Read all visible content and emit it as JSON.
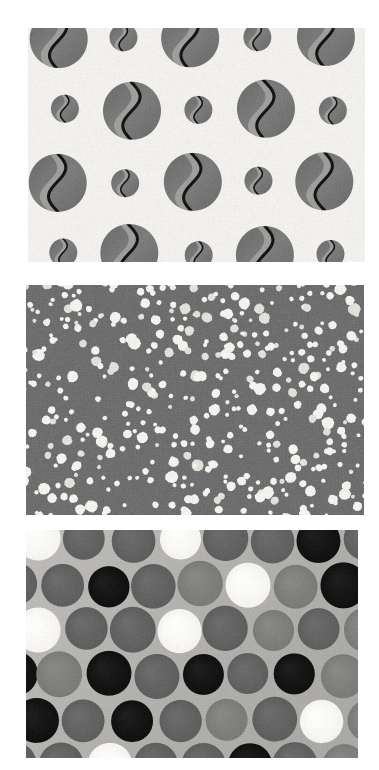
{
  "image": {
    "kind": "photo-collage",
    "description": "Three stacked photographs of polka-dot patterned fabric swatches",
    "background_color": "#ffffff",
    "width": 379,
    "height": 770
  },
  "panels": [
    {
      "id": "beans",
      "name": "coffee-bean-dot-fabric",
      "label": "Cream fabric with gray coffee-bean dots",
      "x": 28,
      "y": 28,
      "width": 337,
      "height": 234,
      "background_color": "#f2f0ec",
      "texture": "woven-linen",
      "pattern_type": "grid",
      "motif": "bean",
      "colors": {
        "fabric": "#f2f0ec",
        "dot_fill": "#7d7d7d",
        "dot_shadow": "#6a6a6a",
        "dot_highlight": "#a7a5a1",
        "bean_line": "#151515"
      },
      "grid": {
        "columns": 6,
        "rows": 4,
        "cell_width": 67,
        "cell_height": 72
      },
      "dot_sizes": {
        "large_radius": 29,
        "small_radius": 14
      },
      "dot_count": 24
    },
    {
      "id": "speckle",
      "name": "white-speckle-dot-fabric",
      "label": "Gray fabric with scattered small white dots",
      "x": 26,
      "y": 285,
      "width": 338,
      "height": 230,
      "background_color": "#6e6e6e",
      "texture": "woven-twill",
      "pattern_type": "scatter",
      "motif": "dot",
      "colors": {
        "fabric": "#6e6e6e",
        "fabric_dark": "#5f5f5f",
        "dot": "#f3f2ee",
        "dot_soft": "#e2e0da"
      },
      "dot_sizes": {
        "min_radius": 2.0,
        "max_radius": 6.5
      },
      "dot_count": 420
    },
    {
      "id": "bigdots",
      "name": "large-polka-dot-fabric",
      "label": "Light gray fabric with large black, gray and white polka dots",
      "x": 26,
      "y": 530,
      "width": 332,
      "height": 228,
      "background_color": "#b2b1ad",
      "texture": "woven-twill",
      "pattern_type": "staggered-grid",
      "motif": "dot",
      "colors": {
        "fabric": "#b2b1ad",
        "black": "#101010",
        "dark_gray": "#5e5e5e",
        "mid_gray": "#7a7a78",
        "white": "#f4f3ef"
      },
      "grid": {
        "columns": 8,
        "rows": 6,
        "cell_width": 47,
        "cell_height": 45,
        "stagger": 23
      },
      "dot_radius": 22,
      "palette_sequence": [
        "dark_gray",
        "black",
        "dark_gray",
        "black",
        "dark_gray",
        "black",
        "dark_gray",
        "mid_gray",
        "dark_gray",
        "white",
        "mid_gray",
        "white",
        "dark_gray",
        "dark_gray",
        "white",
        "dark_gray",
        "dark_gray",
        "black",
        "dark_gray",
        "mid_gray",
        "dark_gray",
        "dark_gray",
        "black",
        "dark_gray",
        "mid_gray",
        "white",
        "mid_gray",
        "black",
        "mid_gray",
        "white",
        "dark_gray",
        "white",
        "dark_gray",
        "dark_gray",
        "white",
        "dark_gray",
        "mid_gray",
        "dark_gray",
        "mid_gray",
        "dark_gray",
        "black",
        "mid_gray",
        "black",
        "dark_gray",
        "black",
        "dark_gray",
        "black",
        "mid_gray"
      ],
      "dot_count": 48
    }
  ]
}
